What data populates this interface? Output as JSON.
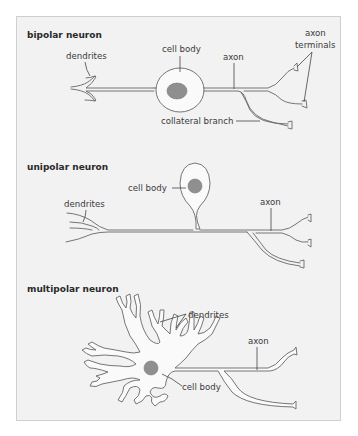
{
  "diagram": {
    "panels": [
      {
        "id": "bipolar",
        "title": "bipolar neuron",
        "labels": {
          "dendrites": "dendrites",
          "cell_body": "cell body",
          "axon": "axon",
          "axon_terminals_line1": "axon",
          "axon_terminals_line2": "terminals",
          "collateral_branch": "collateral branch"
        }
      },
      {
        "id": "unipolar",
        "title": "unipolar neuron",
        "labels": {
          "dendrites": "dendrites",
          "cell_body": "cell body",
          "axon": "axon"
        }
      },
      {
        "id": "multipolar",
        "title": "multipolar neuron",
        "labels": {
          "dendrites": "dendrites",
          "axon": "axon",
          "cell_body": "cell body"
        }
      }
    ],
    "colors": {
      "background": "#f2f2f2",
      "border": "#cfcfcf",
      "outline": "#666666",
      "nucleus": "#8f8f8f",
      "text": "#3a3a3a"
    }
  }
}
